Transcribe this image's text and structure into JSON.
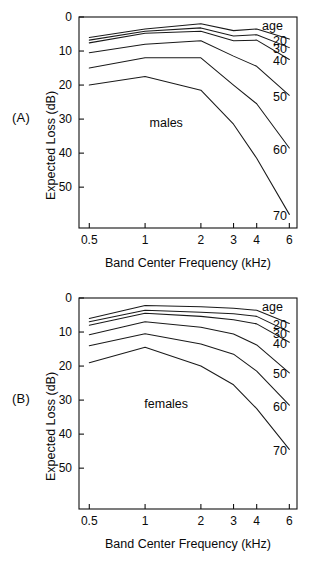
{
  "figure": {
    "panels": [
      {
        "tag": "(A)",
        "group_label": "males",
        "xlabel": "Band Center Frequency (kHz)",
        "ylabel": "Expected Loss (dB)",
        "legend_header": "age"
      },
      {
        "tag": "(B)",
        "group_label": "females",
        "xlabel": "Band Center Frequency (kHz)",
        "ylabel": "Expected Loss (dB)",
        "legend_header": "age"
      }
    ]
  },
  "chart_data": [
    {
      "type": "line",
      "title": "",
      "panel": "(A)",
      "group": "males",
      "xlabel": "Band Center Frequency (kHz)",
      "ylabel": "Expected Loss (dB)",
      "x": [
        0.5,
        1,
        2,
        3,
        4,
        6
      ],
      "xticklabels": [
        "0.5",
        "1",
        "2",
        "3",
        "4",
        "6"
      ],
      "xscale": "log",
      "xlim": [
        0.44,
        6.6
      ],
      "yticks": [
        0,
        10,
        20,
        30,
        40,
        50
      ],
      "ylim": [
        0,
        62
      ],
      "y_inverted": true,
      "grid": false,
      "legend_position": "right-inside",
      "legend_header": "age",
      "series": [
        {
          "name": "20",
          "values": [
            6.0,
            3.5,
            2.0,
            4.0,
            3.5,
            6.5
          ]
        },
        {
          "name": "30",
          "values": [
            6.8,
            4.2,
            3.2,
            5.6,
            5.2,
            9.0
          ]
        },
        {
          "name": "40",
          "values": [
            7.6,
            4.8,
            4.2,
            7.0,
            6.8,
            12.5
          ]
        },
        {
          "name": "50",
          "values": [
            10.5,
            8.0,
            7.0,
            11.5,
            14.5,
            23.0
          ]
        },
        {
          "name": "60",
          "values": [
            15.0,
            12.0,
            12.0,
            20.0,
            25.5,
            38.5
          ]
        },
        {
          "name": "70",
          "values": [
            20.0,
            17.5,
            21.5,
            31.5,
            41.5,
            58.0
          ]
        }
      ]
    },
    {
      "type": "line",
      "title": "",
      "panel": "(B)",
      "group": "females",
      "xlabel": "Band Center Frequency (kHz)",
      "ylabel": "Expected Loss (dB)",
      "x": [
        0.5,
        1,
        2,
        3,
        4,
        6
      ],
      "xticklabels": [
        "0.5",
        "1",
        "2",
        "3",
        "4",
        "6"
      ],
      "xscale": "log",
      "xlim": [
        0.44,
        6.6
      ],
      "yticks": [
        0,
        10,
        20,
        30,
        40,
        50
      ],
      "ylim": [
        0,
        62
      ],
      "y_inverted": true,
      "grid": false,
      "legend_position": "right-inside",
      "legend_header": "age",
      "series": [
        {
          "name": "20",
          "values": [
            6.0,
            2.2,
            2.6,
            3.0,
            3.6,
            7.5
          ]
        },
        {
          "name": "30",
          "values": [
            7.0,
            3.6,
            4.2,
            4.6,
            5.4,
            10.0
          ]
        },
        {
          "name": "40",
          "values": [
            8.0,
            4.5,
            5.4,
            6.4,
            7.6,
            13.0
          ]
        },
        {
          "name": "50",
          "values": [
            10.8,
            7.0,
            8.6,
            10.6,
            13.8,
            22.0
          ]
        },
        {
          "name": "60",
          "values": [
            14.0,
            10.5,
            13.5,
            16.5,
            21.5,
            31.5
          ]
        },
        {
          "name": "70",
          "values": [
            19.0,
            14.5,
            20.0,
            25.5,
            32.5,
            44.5
          ]
        }
      ]
    }
  ]
}
